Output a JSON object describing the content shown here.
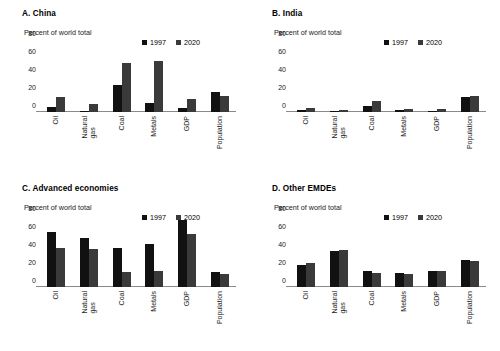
{
  "figure": {
    "y_axis_caption": "Percent of world total",
    "yticks": [
      0,
      20,
      40,
      60,
      80
    ],
    "ylim": [
      0,
      80
    ],
    "categories": [
      "Oil",
      "Natural gas",
      "Coal",
      "Metals",
      "GDP",
      "Population"
    ],
    "legend": [
      {
        "label": "1997",
        "color": "#111111"
      },
      {
        "label": "2020",
        "color": "#3a3a3a"
      }
    ]
  },
  "panels": [
    {
      "id": "panel-a",
      "title": "A. China"
    },
    {
      "id": "panel-b",
      "title": "B. India"
    },
    {
      "id": "panel-c",
      "title": "C. Advanced economies"
    },
    {
      "id": "panel-d",
      "title": "D. Other EMDEs"
    }
  ],
  "chart_data": [
    {
      "type": "bar",
      "title": "A. China",
      "xlabel": "",
      "ylabel": "Percent of world total",
      "ylim": [
        0,
        80
      ],
      "yticks": [
        0,
        20,
        40,
        60,
        80
      ],
      "grid": false,
      "legend_position": "top-right",
      "categories": [
        "Oil",
        "Natural gas",
        "Coal",
        "Metals",
        "GDP",
        "Population"
      ],
      "series": [
        {
          "name": "1997",
          "color": "#111111",
          "values": [
            6,
            1,
            30,
            10,
            4,
            22
          ]
        },
        {
          "name": "2020",
          "color": "#3a3a3a",
          "values": [
            17,
            9,
            54,
            57,
            14,
            18
          ]
        }
      ]
    },
    {
      "type": "bar",
      "title": "B. India",
      "xlabel": "",
      "ylabel": "Percent of world total",
      "ylim": [
        0,
        80
      ],
      "yticks": [
        0,
        20,
        40,
        60,
        80
      ],
      "grid": false,
      "legend_position": "top-right",
      "categories": [
        "Oil",
        "Natural gas",
        "Coal",
        "Metals",
        "GDP",
        "Population"
      ],
      "series": [
        {
          "name": "1997",
          "color": "#111111",
          "values": [
            2,
            1,
            7,
            2,
            1,
            17
          ]
        },
        {
          "name": "2020",
          "color": "#3a3a3a",
          "values": [
            5,
            2,
            12,
            3,
            3,
            18
          ]
        }
      ]
    },
    {
      "type": "bar",
      "title": "C. Advanced economies",
      "xlabel": "",
      "ylabel": "Percent of world total",
      "ylim": [
        0,
        80
      ],
      "yticks": [
        0,
        20,
        40,
        60,
        80
      ],
      "grid": false,
      "legend_position": "top-right",
      "categories": [
        "Oil",
        "Natural gas",
        "Coal",
        "Metals",
        "GDP",
        "Population"
      ],
      "series": [
        {
          "name": "1997",
          "color": "#111111",
          "values": [
            61,
            54,
            43,
            48,
            75,
            17
          ]
        },
        {
          "name": "2020",
          "color": "#3a3a3a",
          "values": [
            43,
            42,
            17,
            18,
            59,
            14
          ]
        }
      ]
    },
    {
      "type": "bar",
      "title": "D. Other EMDEs",
      "xlabel": "",
      "ylabel": "Percent of world total",
      "ylim": [
        0,
        80
      ],
      "yticks": [
        0,
        20,
        40,
        60,
        80
      ],
      "grid": false,
      "legend_position": "top-right",
      "categories": [
        "Oil",
        "Natural gas",
        "Coal",
        "Metals",
        "GDP",
        "Population"
      ],
      "series": [
        {
          "name": "1997",
          "color": "#111111",
          "values": [
            25,
            40,
            18,
            16,
            18,
            30
          ]
        },
        {
          "name": "2020",
          "color": "#3a3a3a",
          "values": [
            27,
            41,
            16,
            14,
            18,
            29
          ]
        }
      ]
    }
  ]
}
